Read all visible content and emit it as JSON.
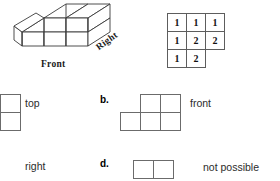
{
  "figure": {
    "name": "isometric-cube-stack",
    "front_label": "Front",
    "right_label": "Right"
  },
  "plan_grid": {
    "caption": "",
    "rows": [
      [
        "1",
        "1",
        "1"
      ],
      [
        "1",
        "2",
        "2"
      ],
      [
        "1",
        "2",
        ""
      ]
    ]
  },
  "options": [
    {
      "marker": "",
      "label": "top",
      "grid_rows": [
        [
          1,
          1
        ],
        [
          1,
          1
        ]
      ]
    },
    {
      "marker": "b.",
      "label": "front",
      "grid_rows": [
        [
          0,
          1,
          1
        ],
        [
          1,
          1,
          1
        ]
      ]
    },
    {
      "marker": "",
      "label": "right",
      "grid_rows": [
        [
          1,
          1
        ],
        [
          1,
          1
        ]
      ]
    },
    {
      "marker": "d.",
      "label": "not possible",
      "grid_rows": [
        [
          1,
          1
        ]
      ]
    }
  ],
  "colors": {
    "ink": "#000000",
    "grid_line": "#5d5d5d",
    "option_text": "#2b2b2b",
    "paper": "#ffffff"
  }
}
